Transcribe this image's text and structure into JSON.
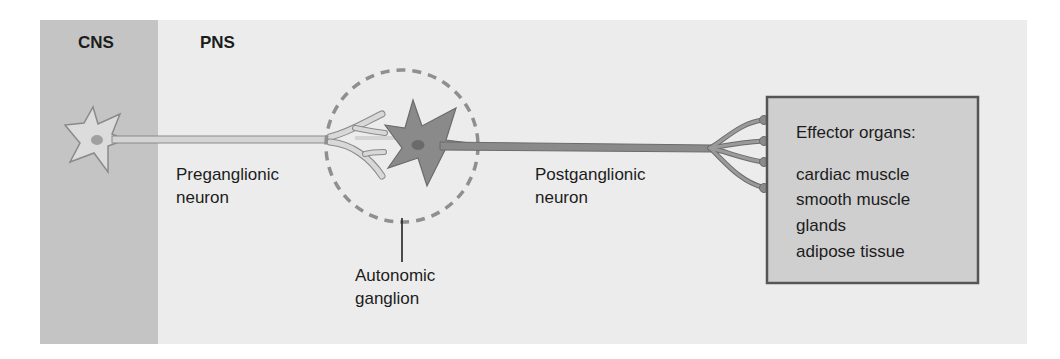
{
  "diagram": {
    "regions": [
      {
        "id": "cns",
        "label": "CNS",
        "color": "#c4c4c4"
      },
      {
        "id": "pns",
        "label": "PNS",
        "color": "#ececec"
      }
    ],
    "labels": {
      "preganglionic_line1": "Preganglionic",
      "preganglionic_line2": "neuron",
      "postganglionic_line1": "Postganglionic",
      "postganglionic_line2": "neuron",
      "ganglion_line1": "Autonomic",
      "ganglion_line2": "ganglion"
    },
    "effector_box": {
      "title": "Effector organs:",
      "items": [
        "cardiac muscle",
        "smooth muscle",
        "glands",
        "adipose tissue"
      ],
      "color": "#cfcfcf",
      "border": "#555555"
    },
    "colors": {
      "preganglionic_neuron": "#d4d4d4",
      "postganglionic_neuron": "#8a8a8a",
      "nucleus": "#9a9a9a",
      "ganglion_outline": "#8f8f8f"
    }
  }
}
